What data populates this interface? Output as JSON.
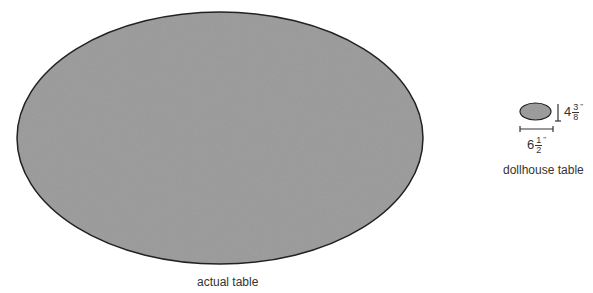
{
  "actual_table": {
    "label": "actual table"
  },
  "dollhouse_table": {
    "label": "dollhouse table",
    "height": {
      "whole": "4",
      "numerator": "3",
      "denominator": "8",
      "unit": "\""
    },
    "width": {
      "whole": "6",
      "numerator": "1",
      "denominator": "2",
      "unit": "\""
    }
  },
  "colors": {
    "fill": "#8a8a8a",
    "outline": "#222222"
  }
}
